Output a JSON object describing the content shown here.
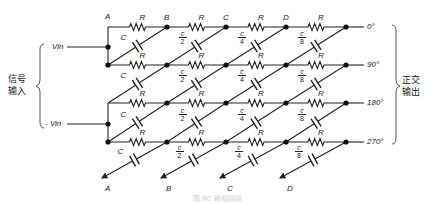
{
  "diagram": {
    "input": {
      "bracket_label_line1": "信号",
      "bracket_label_line2": "输入",
      "vin_pos": "Vin",
      "vin_neg": "- Vin"
    },
    "output": {
      "bracket_label_line1": "正交",
      "bracket_label_line2": "输出",
      "phases": [
        "0°",
        "90°",
        "180°",
        "270°"
      ]
    },
    "node_labels_top": [
      "A",
      "B",
      "C",
      "D"
    ],
    "node_labels_bottom": [
      "A",
      "B",
      "C",
      "D"
    ],
    "resistor_label": "R",
    "capacitor_labels": [
      {
        "num": "C",
        "den": ""
      },
      {
        "num": "c",
        "den": "2"
      },
      {
        "num": "c",
        "den": "4"
      },
      {
        "num": "c",
        "den": "8"
      }
    ],
    "caption": "图 RC 移相网络"
  },
  "colors": {
    "line": "#222222",
    "background": "#ffffff",
    "caption": "#cfcfcf"
  }
}
